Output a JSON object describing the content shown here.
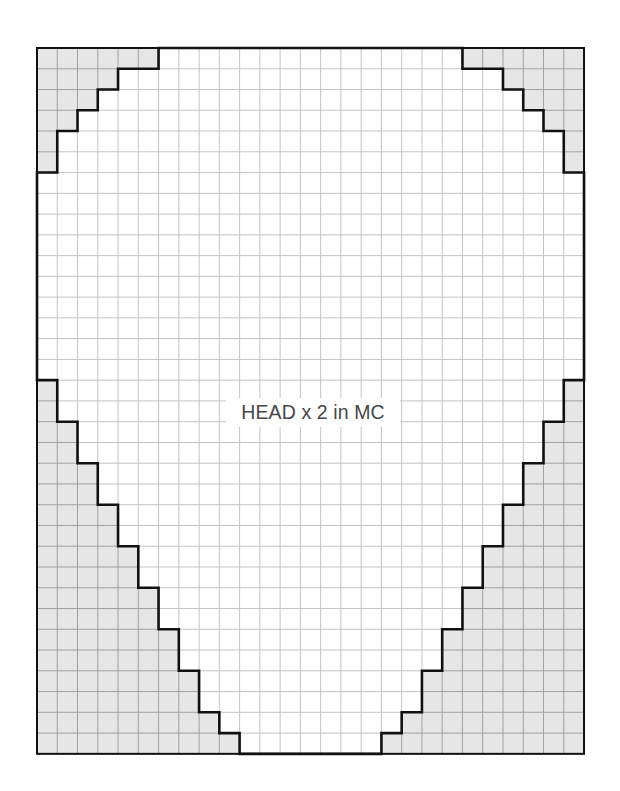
{
  "diagram": {
    "type": "knitting-chart",
    "label": "HEAD x 2 in MC",
    "grid": {
      "columns": 27,
      "rows": 34,
      "left": 37,
      "top": 48,
      "cell_width": 20.26,
      "cell_height": 20.76
    },
    "colors": {
      "shaded": "#e6e6e6",
      "background": "#ffffff",
      "grid_line_shaded": "#9a9a9a",
      "grid_line_white": "#bdbdbd",
      "outline": "#111111",
      "label_text": "#474747"
    },
    "left_shaded_per_row": [
      6,
      4,
      3,
      2,
      1,
      1,
      0,
      0,
      0,
      0,
      0,
      0,
      0,
      0,
      0,
      0,
      1,
      1,
      2,
      2,
      3,
      3,
      4,
      4,
      5,
      5,
      6,
      6,
      7,
      7,
      8,
      8,
      9,
      10
    ],
    "right_shaded_per_row": [
      6,
      4,
      3,
      2,
      1,
      1,
      0,
      0,
      0,
      0,
      0,
      0,
      0,
      0,
      0,
      0,
      1,
      1,
      2,
      2,
      3,
      3,
      4,
      4,
      5,
      5,
      6,
      6,
      7,
      7,
      8,
      8,
      9,
      10
    ]
  }
}
